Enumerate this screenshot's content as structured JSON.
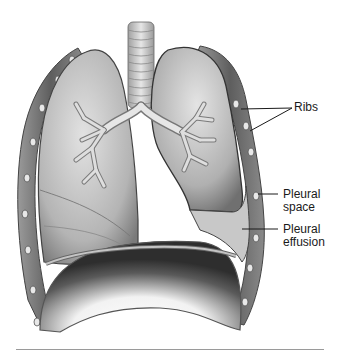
{
  "diagram": {
    "labels": [
      {
        "id": "ribs",
        "text": "Ribs"
      },
      {
        "id": "pleural_space",
        "line1": "Pleural",
        "line2": "space"
      },
      {
        "id": "pleural_effusion",
        "line1": "Pleural",
        "line2": "effusion"
      }
    ],
    "colors": {
      "line": "#222222",
      "lung_light": "#d8d8d8",
      "lung_mid": "#a8a8a8",
      "lung_dark": "#6a6a6a",
      "rule": "#9a9a9a"
    }
  }
}
